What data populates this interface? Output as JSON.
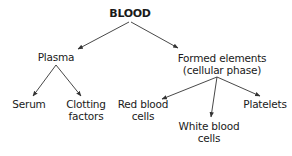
{
  "diagram": {
    "type": "tree",
    "root": {
      "id": "blood",
      "label": "BLOOD",
      "children": [
        {
          "id": "plasma",
          "label": "Plasma",
          "children": [
            {
              "id": "serum",
              "label": "Serum"
            },
            {
              "id": "clotting",
              "label_lines": [
                "Clotting",
                "factors"
              ]
            }
          ]
        },
        {
          "id": "formed",
          "label_lines": [
            "Formed elements",
            "(cellular phase)"
          ],
          "children": [
            {
              "id": "rbc",
              "label_lines": [
                "Red blood",
                "cells"
              ]
            },
            {
              "id": "wbc",
              "label_lines": [
                "White blood",
                "cells"
              ]
            },
            {
              "id": "platelets",
              "label": "Platelets"
            }
          ]
        }
      ]
    },
    "edges": [
      {
        "from": "blood",
        "to": "plasma"
      },
      {
        "from": "blood",
        "to": "formed"
      },
      {
        "from": "plasma",
        "to": "serum"
      },
      {
        "from": "plasma",
        "to": "clotting"
      },
      {
        "from": "formed",
        "to": "rbc"
      },
      {
        "from": "formed",
        "to": "wbc"
      },
      {
        "from": "formed",
        "to": "platelets"
      }
    ],
    "colors": {
      "line": "#333333",
      "text": "#1a1a1a",
      "background": "#ffffff"
    }
  }
}
